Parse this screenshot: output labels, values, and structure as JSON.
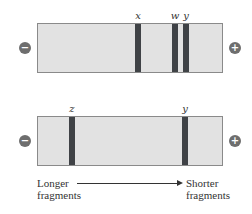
{
  "gel_top": {
    "bands": [
      {
        "label": "x",
        "left": 98
      },
      {
        "label": "w",
        "left": 135
      },
      {
        "label": "y",
        "left": 146
      }
    ],
    "negative_symbol": "−",
    "positive_symbol": "+"
  },
  "gel_bottom": {
    "bands": [
      {
        "label": "z",
        "left": 32
      },
      {
        "label": "y",
        "left": 145
      }
    ],
    "negative_symbol": "−",
    "positive_symbol": "+"
  },
  "caption": {
    "left_line1": "Longer",
    "left_line2": "fragments",
    "right_line1": "Shorter",
    "right_line2": "fragments"
  },
  "colors": {
    "gel": "#e2e2e2",
    "band": "#3f4246",
    "electrode": "#6e6e6e"
  }
}
